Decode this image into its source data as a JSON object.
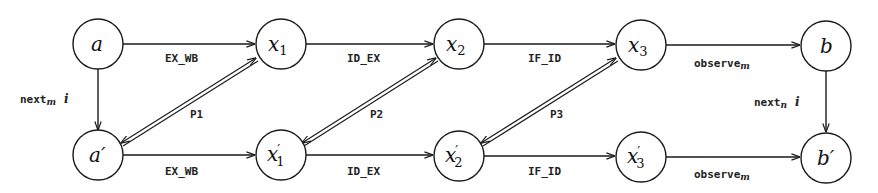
{
  "diagram": {
    "nodes": {
      "a": {
        "base": "a",
        "prime": "",
        "sub": ""
      },
      "x1": {
        "base": "x",
        "prime": "",
        "sub": "1"
      },
      "x2": {
        "base": "x",
        "prime": "",
        "sub": "2"
      },
      "x3": {
        "base": "x",
        "prime": "",
        "sub": "3"
      },
      "b": {
        "base": "b",
        "prime": "",
        "sub": ""
      },
      "a_p": {
        "base": "a",
        "prime": "′",
        "sub": ""
      },
      "x1_p": {
        "base": "x",
        "prime": "′",
        "sub": "1"
      },
      "x2_p": {
        "base": "x",
        "prime": "′",
        "sub": "2"
      },
      "x3_p": {
        "base": "x",
        "prime": "′",
        "sub": "3"
      },
      "b_p": {
        "base": "b",
        "prime": "′",
        "sub": ""
      }
    },
    "edges": {
      "top_ex_wb": "EX_WB",
      "top_id_ex": "ID_EX",
      "top_if_id": "IF_ID",
      "top_observe": {
        "text": "observe",
        "sub": "m"
      },
      "bot_ex_wb": "EX_WB",
      "bot_id_ex": "ID_EX",
      "bot_if_id": "IF_ID",
      "bot_observe": {
        "text": "observe",
        "sub": "m"
      },
      "left_next": {
        "text": "next",
        "sub": "m",
        "arg": "i"
      },
      "right_next": {
        "text": "next",
        "sub": "n",
        "arg": "i"
      }
    },
    "correspondences": {
      "p1": "P1",
      "p2": "P2",
      "p3": "P3"
    },
    "colors": {
      "stroke": "#1a1a1a",
      "background": "#ffffff"
    }
  }
}
